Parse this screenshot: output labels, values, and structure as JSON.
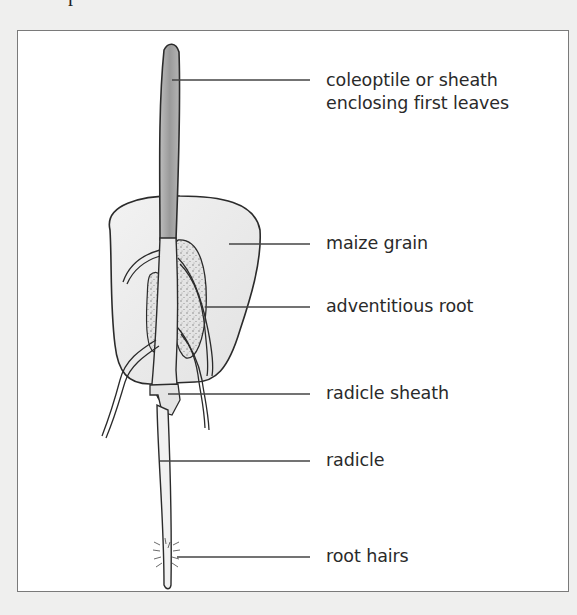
{
  "figure": {
    "type": "labelled-diagram",
    "top_fragment": "r"
  },
  "labels": [
    {
      "id": "coleoptile",
      "line1": "coleoptile or sheath",
      "line2": "enclosing first leaves"
    },
    {
      "id": "maize-grain",
      "text": "maize grain"
    },
    {
      "id": "adventitious-root",
      "text": "adventitious root"
    },
    {
      "id": "radicle-sheath",
      "text": "radicle sheath"
    },
    {
      "id": "radicle",
      "text": "radicle"
    },
    {
      "id": "root-hairs",
      "text": "root hairs"
    }
  ],
  "colors": {
    "page_background": "#efefee",
    "frame_border": "#7a7a7a",
    "outline": "#2b2b2b",
    "coleoptile_fill": "#a9a9a9",
    "grain_fill": "#ececec",
    "leader_line": "#444444",
    "text": "#2a2a2a"
  }
}
